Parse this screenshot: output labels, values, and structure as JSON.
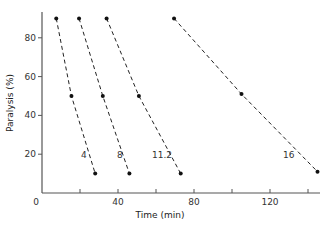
{
  "chart_data": {
    "type": "line",
    "title": "",
    "xlabel": "Time (min)",
    "ylabel": "Paralysis (%)",
    "xlim": [
      0,
      147
    ],
    "ylim": [
      0,
      95
    ],
    "xticks": [
      0,
      20,
      40,
      60,
      80,
      100,
      120,
      140
    ],
    "xtick_labels": [
      "0",
      "",
      "40",
      "",
      "80",
      "",
      "120",
      ""
    ],
    "yticks": [
      20,
      40,
      60,
      80
    ],
    "ytick_labels": [
      "20",
      "40",
      "60",
      "80"
    ],
    "grid": false,
    "legend": "inline labels near each line",
    "line_style": "dashed",
    "marker": "filled circle",
    "series": [
      {
        "name": "4",
        "label": "4",
        "points": [
          [
            7.5,
            90
          ],
          [
            15.5,
            50
          ],
          [
            28,
            10
          ]
        ]
      },
      {
        "name": "8",
        "label": "8",
        "points": [
          [
            19.5,
            90
          ],
          [
            32,
            50
          ],
          [
            46,
            10
          ]
        ]
      },
      {
        "name": "11.2",
        "label": "11.2",
        "points": [
          [
            34,
            90
          ],
          [
            51,
            50
          ],
          [
            73,
            10
          ]
        ]
      },
      {
        "name": "16",
        "label": "16",
        "points": [
          [
            69.5,
            90
          ],
          [
            105,
            51
          ],
          [
            145,
            11
          ]
        ]
      }
    ]
  },
  "layout": {
    "origin_px": [
      42,
      193
    ],
    "px_per_x": 1.9,
    "px_per_y": 1.94,
    "x_axis_end_px": 320,
    "y_axis_top_px": 12,
    "label_positions": {
      "4": [
        81,
        158
      ],
      "8": [
        117,
        158
      ],
      "11.2": [
        152,
        158
      ],
      "16": [
        283,
        158
      ]
    }
  },
  "colors": {
    "axis": "#555555",
    "line": "#222222",
    "marker": "#111111",
    "text": "#333333"
  }
}
